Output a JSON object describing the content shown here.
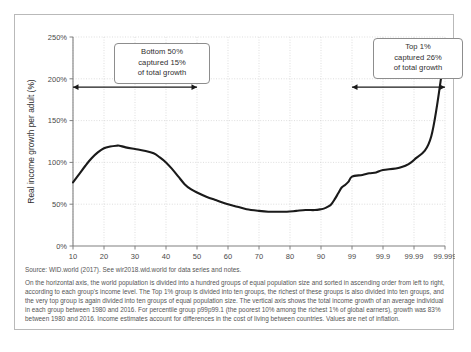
{
  "chart_data": {
    "type": "line",
    "title": "",
    "xlabel": "Income group (percentile)",
    "ylabel": "Real income growth per adult (%)",
    "ylim": [
      0,
      250
    ],
    "ytick_labels": [
      "0%",
      "50%",
      "100%",
      "150%",
      "200%",
      "250%"
    ],
    "ytick_values": [
      0,
      50,
      100,
      150,
      200,
      250
    ],
    "xtick_labels": [
      "10",
      "20",
      "30",
      "40",
      "50",
      "60",
      "70",
      "80",
      "90",
      "99",
      "99.9",
      "99.99",
      "99.999"
    ],
    "xtick_positions": [
      10,
      20,
      30,
      40,
      50,
      60,
      70,
      80,
      90,
      99,
      99.9,
      99.99,
      99.999
    ],
    "grid": true,
    "legend": "none",
    "series": [
      {
        "name": "Real income growth per adult 1980-2016",
        "color": "#1a1a1a",
        "x": [
          10,
          12,
          14,
          16,
          18,
          20,
          22,
          24,
          25,
          27,
          30,
          33,
          36,
          38,
          40,
          42,
          44,
          46,
          48,
          50,
          53,
          56,
          60,
          63,
          66,
          70,
          73,
          76,
          79,
          82,
          85,
          88,
          90,
          91,
          92,
          93,
          94,
          95,
          96,
          97,
          98,
          99,
          99.3,
          99.5,
          99.7,
          99.9,
          99.95,
          99.99,
          99.995,
          99.999
        ],
        "values": [
          76,
          86,
          96,
          105,
          112,
          117,
          119,
          120,
          120,
          118,
          116,
          114,
          111,
          106,
          100,
          92,
          83,
          74,
          68,
          64,
          59,
          55,
          50,
          47,
          44,
          42,
          41,
          41,
          41,
          42,
          43,
          43,
          44,
          45,
          47,
          50,
          56,
          63,
          70,
          73,
          77,
          83,
          85,
          87,
          88,
          91,
          94,
          103,
          131,
          235
        ]
      }
    ],
    "annotations": [
      {
        "id": "bottom50",
        "lines": [
          "Bottom 50%",
          "captured 15%",
          "of total growth"
        ],
        "arrow_from_x": 10,
        "arrow_to_x": 50,
        "arrow_y": 190
      },
      {
        "id": "top1",
        "lines": [
          "Top 1%",
          "captured 26%",
          "of total growth"
        ],
        "arrow_from_x": 99,
        "arrow_to_x": 99.999,
        "arrow_y": 190
      }
    ]
  },
  "notes": {
    "source": "Source: WID.world (2017). See wir2018.wid.world for data series and notes.",
    "body": "On the horizontal axis, the world population is divided into a hundred groups of equal population size and sorted in ascending order from left to right, according to each group's income level. The Top 1% group is divided into ten groups, the richest of these groups is also divided into ten groups, and the very top group is again divided into ten groups of equal population size. The vertical axis shows the total income growth of an average individual in each group between 1980 and 2016. For percentile group p99p99.1 (the poorest 10% among the richest 1% of global earners), growth was 83% between 1980 and 2016. Income estimates account for differences in the cost of living between countries. Values are net of inflation."
  },
  "colors": {
    "line": "#1a1a1a",
    "grid": "#d0d0d0",
    "axis": "#808080",
    "frame": "#b9b9b9",
    "text": "#555555"
  }
}
